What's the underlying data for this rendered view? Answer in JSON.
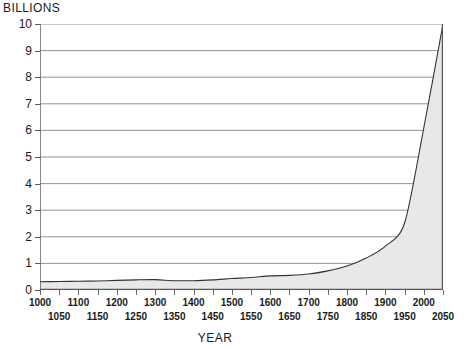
{
  "chart_data": {
    "type": "area",
    "title": "",
    "ylabel": "BILLIONS",
    "xlabel": "YEAR",
    "ylim": [
      0,
      10
    ],
    "xlim": [
      1000,
      2050
    ],
    "grid": true,
    "legend": null,
    "fill_color": "#e8e8e8",
    "line_color": "#333333",
    "grid_color": "#888888",
    "y_ticks": [
      "10",
      "9",
      "8",
      "7",
      "6",
      "5",
      "4",
      "3",
      "2",
      "1",
      "0"
    ],
    "x_ticks_upper": [
      "1000",
      "1100",
      "1200",
      "1300",
      "1400",
      "1500",
      "1600",
      "1700",
      "1800",
      "1900",
      "2000"
    ],
    "x_ticks_lower": [
      "1050",
      "1150",
      "1250",
      "1350",
      "1450",
      "1550",
      "1650",
      "1750",
      "1850",
      "1950",
      "2050"
    ],
    "x": [
      1000,
      1050,
      1100,
      1150,
      1200,
      1250,
      1300,
      1350,
      1400,
      1450,
      1500,
      1550,
      1600,
      1650,
      1700,
      1750,
      1800,
      1850,
      1900,
      1950,
      2000,
      2050
    ],
    "values": [
      0.31,
      0.32,
      0.33,
      0.34,
      0.36,
      0.38,
      0.39,
      0.35,
      0.35,
      0.38,
      0.43,
      0.47,
      0.53,
      0.55,
      0.6,
      0.72,
      0.9,
      1.2,
      1.65,
      2.52,
      6.1,
      10.0
    ]
  },
  "axis": {
    "y_title": "BILLIONS",
    "x_title": "YEAR"
  }
}
